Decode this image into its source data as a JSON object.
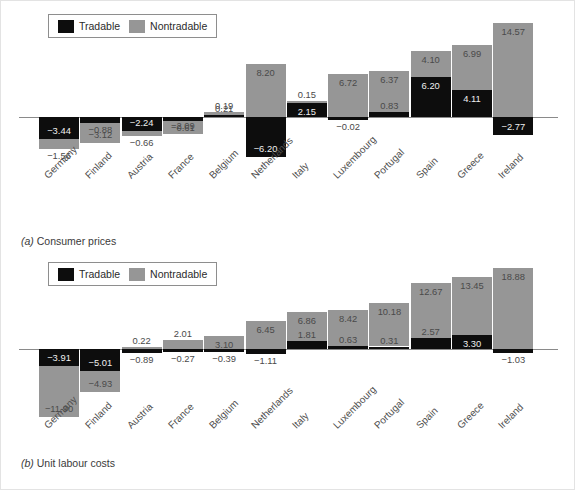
{
  "legend": {
    "tradable_label": "Tradable",
    "nontradable_label": "Nontradable",
    "tradable_color": "#0d0d0d",
    "nontradable_color": "#969696"
  },
  "panels": [
    {
      "id": "a",
      "marker": "(a)",
      "caption": "Consumer prices"
    },
    {
      "id": "b",
      "marker": "(b)",
      "caption": "Unit labour costs"
    }
  ],
  "chart_data": [
    {
      "type": "bar",
      "title": "(a) Consumer prices",
      "xlabel": "",
      "ylabel": "",
      "stacked": true,
      "grid": false,
      "legend_position": "top-left",
      "ylim": [
        -8,
        18
      ],
      "categories": [
        "Germany",
        "Finland",
        "Austria",
        "France",
        "Belgium",
        "Netherlands",
        "Italy",
        "Luxembourg",
        "Portugal",
        "Spain",
        "Greece",
        "Ireland"
      ],
      "series": [
        {
          "name": "Tradable",
          "color": "#0d0d0d",
          "values": [
            -3.44,
            -0.88,
            -2.24,
            -0.61,
            0.21,
            -6.2,
            2.15,
            -0.02,
            0.83,
            6.2,
            4.11,
            -2.77
          ]
        },
        {
          "name": "Nontradable",
          "color": "#969696",
          "values": [
            -1.56,
            -3.12,
            -0.66,
            -2.09,
            0.19,
            8.2,
            0.15,
            6.72,
            6.37,
            4.1,
            6.99,
            14.57
          ]
        }
      ]
    },
    {
      "type": "bar",
      "title": "(b) Unit labour costs",
      "xlabel": "",
      "ylabel": "",
      "stacked": true,
      "grid": false,
      "legend_position": "top-left",
      "ylim": [
        -14,
        22
      ],
      "categories": [
        "Germany",
        "Finland",
        "Austria",
        "France",
        "Belgium",
        "Netherlands",
        "Italy",
        "Luxembourg",
        "Portugal",
        "Spain",
        "Greece",
        "Ireland"
      ],
      "series": [
        {
          "name": "Tradable",
          "color": "#0d0d0d",
          "values": [
            -3.91,
            -5.01,
            -0.89,
            -0.27,
            -0.39,
            -1.11,
            1.81,
            0.63,
            0.31,
            2.57,
            3.3,
            -1.03
          ]
        },
        {
          "name": "Nontradable",
          "color": "#969696",
          "values": [
            -11.9,
            -4.93,
            0.22,
            2.01,
            3.1,
            6.45,
            6.86,
            8.42,
            10.18,
            12.67,
            13.45,
            18.88
          ]
        }
      ]
    }
  ]
}
